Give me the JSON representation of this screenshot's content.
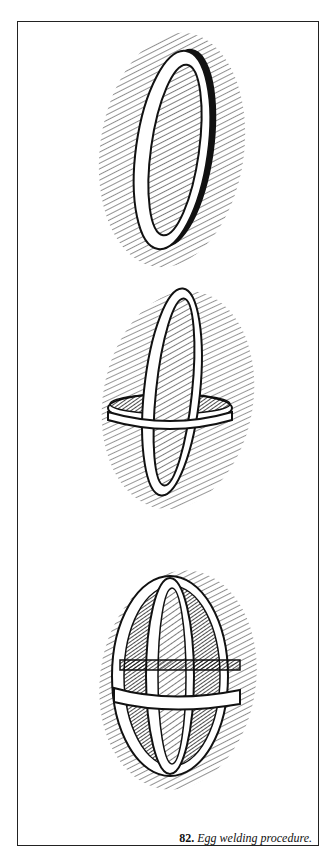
{
  "figure": {
    "number": "82.",
    "caption": "Egg welding procedure.",
    "steps": [
      {
        "label": "single-band-egg-ring"
      },
      {
        "label": "vertical-ring-with-horizontal-band"
      },
      {
        "label": "completed-egg-cage"
      }
    ]
  }
}
